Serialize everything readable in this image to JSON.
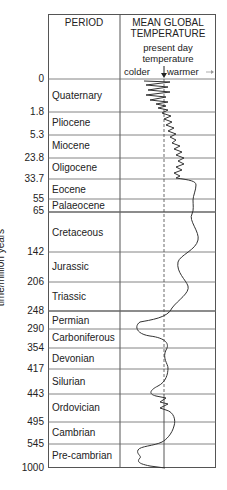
{
  "header": {
    "period": "PERIOD",
    "temperature_line1": "MEAN GLOBAL",
    "temperature_line2": "TEMPERATURE",
    "sub_line1": "present day",
    "sub_line2": "temperature",
    "colder": "colder",
    "warmer": "warmer"
  },
  "y_axis_label": "time/million years",
  "boundaries": [
    "0",
    "1.8",
    "5.3",
    "23.8",
    "33.7",
    "55",
    "65",
    "142",
    "206",
    "248",
    "290",
    "354",
    "417",
    "443",
    "495",
    "545",
    "1000"
  ],
  "periods": [
    "Quaternary",
    "Pliocene",
    "Miocene",
    "Oligocene",
    "Eocene",
    "Palaeocene",
    "Cretaceous",
    "Jurassic",
    "Triassic",
    "Permian",
    "Carboniferous",
    "Devonian",
    "Silurian",
    "Ordovician",
    "Cambrian",
    "Pre-cambrian"
  ],
  "colors": {
    "line": "#333333",
    "grid": "#666666",
    "text": "#222222"
  }
}
